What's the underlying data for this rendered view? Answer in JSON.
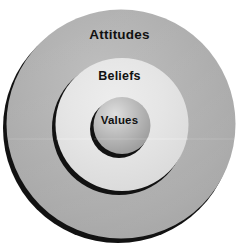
{
  "diagram": {
    "type": "concentric-circles",
    "title": "",
    "background_color": "#ffffff",
    "layers": [
      {
        "id": "attitudes",
        "label": "Attitudes",
        "level": 1,
        "position": "outer",
        "fill_color": "#a9a9a9",
        "label_color": "#111111",
        "center": {
          "x": 120,
          "y": 125
        },
        "radius": 115
      },
      {
        "id": "beliefs",
        "label": "Beliefs",
        "level": 2,
        "position": "middle",
        "fill_color": "#e2e2e2",
        "label_color": "#111111",
        "center": {
          "x": 121,
          "y": 125
        },
        "radius": 67
      },
      {
        "id": "values",
        "label": "Values",
        "level": 3,
        "position": "inner",
        "fill_color": "#b4b4b4",
        "label_color": "#111111",
        "center": {
          "x": 121,
          "y": 126
        },
        "radius": 29
      }
    ],
    "shadow_color": "#141414"
  }
}
